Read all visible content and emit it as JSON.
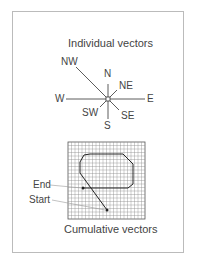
{
  "top": {
    "title": "Individual vectors",
    "directions": [
      {
        "label": "N"
      },
      {
        "label": "NE"
      },
      {
        "label": "E"
      },
      {
        "label": "SE"
      },
      {
        "label": "S"
      },
      {
        "label": "SW"
      },
      {
        "label": "W"
      },
      {
        "label": "NW"
      }
    ]
  },
  "bottom": {
    "title": "Cumulative vectors",
    "end_label": "End",
    "start_label": "Start"
  },
  "colors": {
    "line": "#333333",
    "grid": "#888888",
    "text": "#444444"
  }
}
